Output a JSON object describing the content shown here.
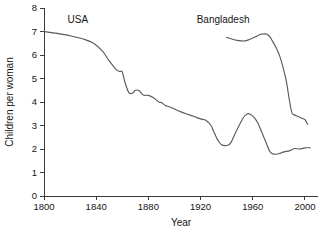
{
  "chart_data": {
    "type": "line",
    "title": "",
    "xlabel": "Year",
    "ylabel": "Children per woman",
    "xlim": [
      1800,
      2010
    ],
    "ylim": [
      0,
      8
    ],
    "xticks": [
      1800,
      1840,
      1880,
      1920,
      1960,
      2000
    ],
    "xtick_labels": [
      "1800",
      "1840",
      "1880",
      "1920",
      "1960",
      "2000"
    ],
    "yticks": [
      0,
      1,
      2,
      3,
      4,
      5,
      6,
      7,
      8
    ],
    "ytick_labels": [
      "0",
      "1",
      "2",
      "3",
      "4",
      "5",
      "6",
      "7",
      "8"
    ],
    "grid": false,
    "legend_position": "inline-labels",
    "line_color": "#5a5a5e",
    "axis_color": "#3a3a3a",
    "background_color": "#ffffff",
    "series": [
      {
        "name": "USA",
        "label": "USA",
        "label_x": 1818,
        "label_y": 7.35,
        "x": [
          1800,
          1810,
          1820,
          1830,
          1838,
          1845,
          1850,
          1855,
          1858,
          1860,
          1862,
          1865,
          1868,
          1870,
          1873,
          1876,
          1880,
          1884,
          1888,
          1890,
          1893,
          1896,
          1900,
          1905,
          1910,
          1915,
          1920,
          1924,
          1928,
          1930,
          1933,
          1936,
          1940,
          1943,
          1946,
          1950,
          1953,
          1956,
          1958,
          1961,
          1964,
          1967,
          1970,
          1973,
          1976,
          1980,
          1984,
          1988,
          1992,
          1996,
          2000,
          2004
        ],
        "y": [
          7.0,
          6.92,
          6.82,
          6.68,
          6.5,
          6.15,
          5.75,
          5.4,
          5.3,
          5.28,
          4.85,
          4.4,
          4.38,
          4.5,
          4.48,
          4.3,
          4.28,
          4.18,
          4.0,
          3.98,
          3.85,
          3.8,
          3.7,
          3.58,
          3.48,
          3.38,
          3.28,
          3.22,
          3.0,
          2.75,
          2.4,
          2.18,
          2.15,
          2.25,
          2.6,
          3.05,
          3.35,
          3.5,
          3.48,
          3.35,
          3.1,
          2.7,
          2.3,
          1.9,
          1.78,
          1.8,
          1.88,
          1.92,
          2.02,
          2.0,
          2.05,
          2.05
        ]
      },
      {
        "name": "Bangladesh",
        "label": "Bangladesh",
        "label_x": 1917,
        "label_y": 7.35,
        "x": [
          1940,
          1944,
          1948,
          1951,
          1954,
          1957,
          1960,
          1963,
          1966,
          1969,
          1971,
          1973,
          1975,
          1978,
          1981,
          1984,
          1986,
          1988,
          1990,
          1992,
          1994,
          1996,
          1998,
          2000,
          2002
        ],
        "y": [
          6.75,
          6.68,
          6.62,
          6.6,
          6.6,
          6.65,
          6.72,
          6.8,
          6.88,
          6.9,
          6.88,
          6.78,
          6.6,
          6.3,
          5.9,
          5.3,
          4.8,
          4.1,
          3.55,
          3.45,
          3.4,
          3.35,
          3.3,
          3.25,
          3.05
        ]
      }
    ]
  }
}
